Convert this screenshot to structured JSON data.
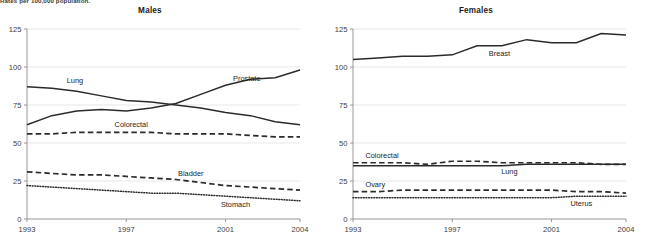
{
  "figure": {
    "caption_top": "Rates per 100,000 population.",
    "background": "#ffffff",
    "line_color": "#2b2b2b"
  },
  "panels": {
    "males": {
      "title": "Males"
    },
    "females": {
      "title": "Females"
    }
  },
  "axis": {
    "y_ticks": [
      "0",
      "25",
      "50",
      "75",
      "100",
      "125"
    ],
    "x_ticks": [
      "1993",
      "1997",
      "2001",
      "2004"
    ],
    "y_min": 0,
    "y_max": 125,
    "x_min": 1993,
    "x_max": 2004
  },
  "labels": {
    "males": {
      "lung": "Lung",
      "prostate": "Prostate",
      "colorectal": "Colorectal",
      "bladder": "Bladder",
      "stomach": "Stomach"
    },
    "females": {
      "breast": "Breast",
      "colorectal": "Colorectal",
      "lung": "Lung",
      "ovary": "Ovary",
      "uterus": "Uterus"
    }
  },
  "chart_data": [
    {
      "type": "line",
      "title": "Males",
      "subtitle": "Rates per 100,000 population.",
      "xlabel": "",
      "ylabel": "Rates per 100,000 population",
      "xlim": [
        1993,
        2004
      ],
      "ylim": [
        0,
        125
      ],
      "grid": true,
      "legend": "inline-annotations",
      "x": [
        1993,
        1994,
        1995,
        1996,
        1997,
        1998,
        1999,
        2000,
        2001,
        2002,
        2003,
        2004
      ],
      "series": [
        {
          "name": "Lung",
          "style": "solid",
          "values": [
            87,
            86,
            84,
            81,
            78,
            77,
            75,
            73,
            70,
            68,
            64,
            62
          ]
        },
        {
          "name": "Prostate",
          "style": "solid",
          "values": [
            62,
            68,
            71,
            72,
            71,
            73,
            76,
            82,
            88,
            92,
            93,
            98
          ]
        },
        {
          "name": "Colorectal",
          "style": "dashed",
          "values": [
            56,
            56,
            57,
            57,
            57,
            57,
            56,
            56,
            56,
            55,
            54,
            54
          ]
        },
        {
          "name": "Bladder",
          "style": "dashed",
          "values": [
            31,
            30,
            29,
            29,
            28,
            27,
            26,
            24,
            22,
            21,
            20,
            19
          ]
        },
        {
          "name": "Stomach",
          "style": "dotted",
          "values": [
            22,
            21,
            20,
            19,
            18,
            17,
            17,
            16,
            15,
            14,
            13,
            12
          ]
        }
      ]
    },
    {
      "type": "line",
      "title": "Females",
      "subtitle": "Rates per 100,000 population.",
      "xlabel": "",
      "ylabel": "Rates per 100,000 population",
      "xlim": [
        1993,
        2004
      ],
      "ylim": [
        0,
        125
      ],
      "grid": true,
      "legend": "inline-annotations",
      "x": [
        1993,
        1994,
        1995,
        1996,
        1997,
        1998,
        1999,
        2000,
        2001,
        2002,
        2003,
        2004
      ],
      "series": [
        {
          "name": "Breast",
          "style": "solid",
          "values": [
            105,
            106,
            107,
            107,
            108,
            114,
            114,
            118,
            116,
            116,
            122,
            121
          ]
        },
        {
          "name": "Colorectal",
          "style": "dashed",
          "values": [
            37,
            37,
            37,
            36,
            38,
            38,
            37,
            37,
            37,
            37,
            36,
            36
          ]
        },
        {
          "name": "Lung",
          "style": "solid",
          "values": [
            35,
            35,
            35,
            35,
            35,
            35,
            35,
            36,
            36,
            36,
            36,
            36
          ]
        },
        {
          "name": "Ovary",
          "style": "dashed",
          "values": [
            18,
            18,
            19,
            19,
            19,
            19,
            19,
            19,
            19,
            18,
            18,
            17
          ]
        },
        {
          "name": "Uterus",
          "style": "dotted",
          "values": [
            14,
            14,
            14,
            14,
            14,
            14,
            14,
            14,
            14,
            15,
            15,
            15
          ]
        }
      ]
    }
  ]
}
